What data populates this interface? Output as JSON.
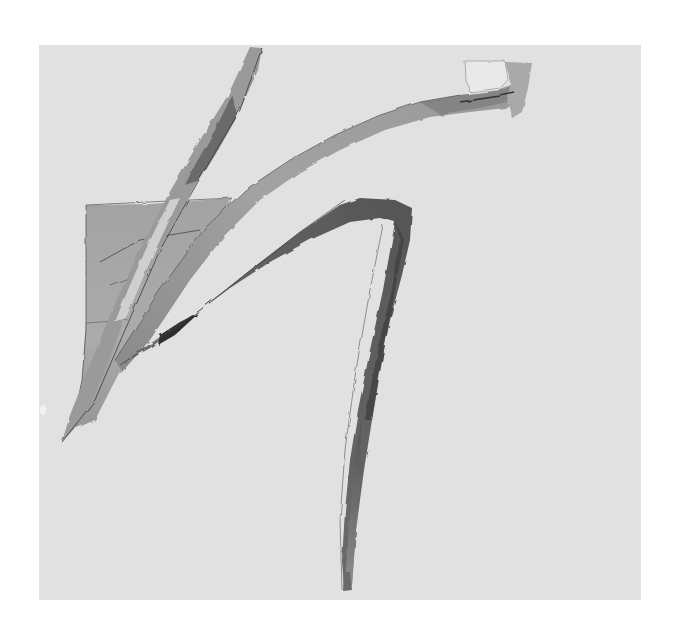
{
  "image": {
    "description": "Photograph of an abstract monochrome drawing on light grey paper: sweeping graphite and wash strokes forming angular, calligraphic shapes",
    "background_color": "#ffffff",
    "paper_color": "#e3e3e3",
    "stroke_colors": {
      "light": "#b8b8b8",
      "mid": "#8d8d8d",
      "dark": "#4a4a4a",
      "line": "#3a3a3a"
    },
    "elements": [
      {
        "id": "diagonal-strip",
        "label": "Narrow diagonal strip from top-centre down to lower left"
      },
      {
        "id": "trapezoid-patch",
        "label": "Grey washed trapezoid patch on left side"
      },
      {
        "id": "sweeping-arc",
        "label": "Long sweeping band rising to the upper right, ending in a pale block"
      },
      {
        "id": "lambda-stroke",
        "label": "Inverted-V stroke with a long leg descending to the bottom"
      }
    ]
  }
}
